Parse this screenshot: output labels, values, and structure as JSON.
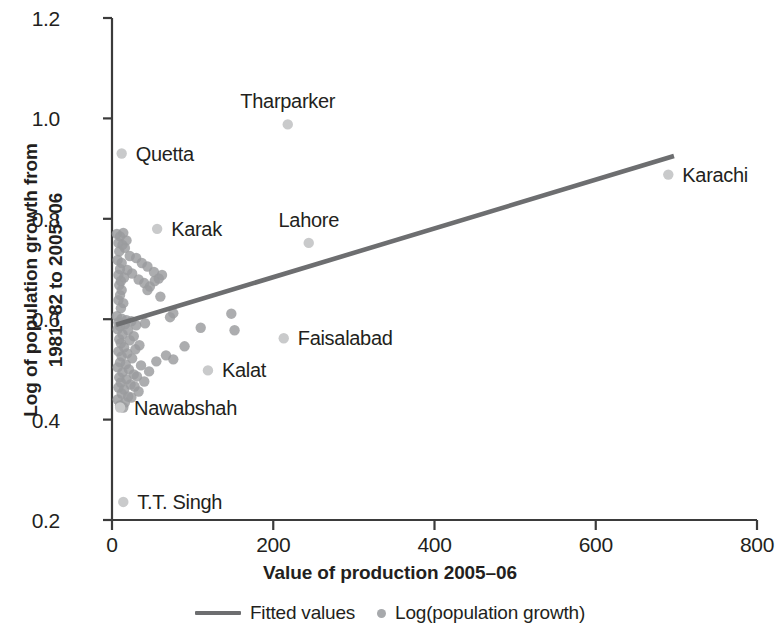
{
  "chart_data": {
    "type": "scatter",
    "title": "",
    "xlabel": "Value of production 2005–06",
    "ylabel_line1": "Log of population growth from",
    "ylabel_line2": "1981–82 to 2005–06",
    "xlim": [
      0,
      800
    ],
    "ylim": [
      0.2,
      1.2
    ],
    "xticks": [
      0,
      200,
      400,
      600,
      800
    ],
    "xtick_labels": [
      "0",
      "200",
      "400",
      "600",
      "800"
    ],
    "yticks": [
      0.2,
      0.4,
      0.6,
      0.8,
      1.0,
      1.2
    ],
    "ytick_labels": [
      "0.2",
      "0.4",
      "0.6",
      "0.8",
      "1.0",
      "1.2"
    ],
    "grid": false,
    "legend_position": "bottom-center",
    "legend": [
      {
        "key": "fitted-values",
        "label": "Fitted values",
        "marker": "line",
        "color": "#6d6e70"
      },
      {
        "key": "log-population-growth",
        "label": "Log(population growth)",
        "marker": "dot",
        "color": "#a7a9ac"
      }
    ],
    "series": [
      {
        "name": "Log(population growth)",
        "marker": "circle",
        "color": "#9a9b9e",
        "points": [
          {
            "x": 6,
            "y": 0.77
          },
          {
            "x": 10,
            "y": 0.765
          },
          {
            "x": 14,
            "y": 0.772
          },
          {
            "x": 8,
            "y": 0.752
          },
          {
            "x": 13,
            "y": 0.748
          },
          {
            "x": 18,
            "y": 0.757
          },
          {
            "x": 9,
            "y": 0.735
          },
          {
            "x": 16,
            "y": 0.742
          },
          {
            "x": 22,
            "y": 0.726
          },
          {
            "x": 7,
            "y": 0.718
          },
          {
            "x": 12,
            "y": 0.712
          },
          {
            "x": 30,
            "y": 0.722
          },
          {
            "x": 10,
            "y": 0.7
          },
          {
            "x": 19,
            "y": 0.698
          },
          {
            "x": 37,
            "y": 0.712
          },
          {
            "x": 8,
            "y": 0.688
          },
          {
            "x": 15,
            "y": 0.683
          },
          {
            "x": 44,
            "y": 0.705
          },
          {
            "x": 11,
            "y": 0.676
          },
          {
            "x": 25,
            "y": 0.691
          },
          {
            "x": 52,
            "y": 0.694
          },
          {
            "x": 9,
            "y": 0.668
          },
          {
            "x": 33,
            "y": 0.679
          },
          {
            "x": 58,
            "y": 0.681
          },
          {
            "x": 12,
            "y": 0.658
          },
          {
            "x": 40,
            "y": 0.672
          },
          {
            "x": 47,
            "y": 0.665
          },
          {
            "x": 10,
            "y": 0.648
          },
          {
            "x": 53,
            "y": 0.676
          },
          {
            "x": 62,
            "y": 0.688
          },
          {
            "x": 8,
            "y": 0.638
          },
          {
            "x": 14,
            "y": 0.632
          },
          {
            "x": 44,
            "y": 0.658
          },
          {
            "x": 11,
            "y": 0.622
          },
          {
            "x": 60,
            "y": 0.645
          },
          {
            "x": 72,
            "y": 0.604
          },
          {
            "x": 6,
            "y": 0.606
          },
          {
            "x": 12,
            "y": 0.601
          },
          {
            "x": 18,
            "y": 0.598
          },
          {
            "x": 8,
            "y": 0.594
          },
          {
            "x": 16,
            "y": 0.59
          },
          {
            "x": 24,
            "y": 0.596
          },
          {
            "x": 10,
            "y": 0.586
          },
          {
            "x": 30,
            "y": 0.588
          },
          {
            "x": 76,
            "y": 0.612
          },
          {
            "x": 7,
            "y": 0.58
          },
          {
            "x": 20,
            "y": 0.578
          },
          {
            "x": 41,
            "y": 0.592
          },
          {
            "x": 13,
            "y": 0.57
          },
          {
            "x": 27,
            "y": 0.566
          },
          {
            "x": 110,
            "y": 0.583
          },
          {
            "x": 9,
            "y": 0.56
          },
          {
            "x": 22,
            "y": 0.558
          },
          {
            "x": 148,
            "y": 0.611
          },
          {
            "x": 11,
            "y": 0.552
          },
          {
            "x": 34,
            "y": 0.548
          },
          {
            "x": 152,
            "y": 0.578
          },
          {
            "x": 15,
            "y": 0.544
          },
          {
            "x": 29,
            "y": 0.54
          },
          {
            "x": 90,
            "y": 0.546
          },
          {
            "x": 8,
            "y": 0.536
          },
          {
            "x": 19,
            "y": 0.532
          },
          {
            "x": 67,
            "y": 0.528
          },
          {
            "x": 12,
            "y": 0.526
          },
          {
            "x": 25,
            "y": 0.522
          },
          {
            "x": 76,
            "y": 0.52
          },
          {
            "x": 10,
            "y": 0.514
          },
          {
            "x": 17,
            "y": 0.51
          },
          {
            "x": 55,
            "y": 0.516
          },
          {
            "x": 7,
            "y": 0.504
          },
          {
            "x": 21,
            "y": 0.5
          },
          {
            "x": 36,
            "y": 0.508
          },
          {
            "x": 13,
            "y": 0.494
          },
          {
            "x": 27,
            "y": 0.49
          },
          {
            "x": 46,
            "y": 0.496
          },
          {
            "x": 9,
            "y": 0.484
          },
          {
            "x": 18,
            "y": 0.48
          },
          {
            "x": 31,
            "y": 0.486
          },
          {
            "x": 11,
            "y": 0.474
          },
          {
            "x": 23,
            "y": 0.47
          },
          {
            "x": 40,
            "y": 0.476
          },
          {
            "x": 8,
            "y": 0.464
          },
          {
            "x": 15,
            "y": 0.46
          },
          {
            "x": 28,
            "y": 0.466
          },
          {
            "x": 12,
            "y": 0.452
          },
          {
            "x": 20,
            "y": 0.446
          },
          {
            "x": 33,
            "y": 0.456
          },
          {
            "x": 7,
            "y": 0.44
          },
          {
            "x": 16,
            "y": 0.434
          },
          {
            "x": 24,
            "y": 0.444
          },
          {
            "x": 10,
            "y": 0.428
          },
          {
            "x": 14,
            "y": 0.424
          }
        ]
      }
    ],
    "annotated_points": [
      {
        "label": "Quetta",
        "x": 12,
        "y": 0.93,
        "label_anchor": "right"
      },
      {
        "label": "Tharparker",
        "x": 218,
        "y": 0.988,
        "label_anchor": "above"
      },
      {
        "label": "Karachi",
        "x": 690,
        "y": 0.888,
        "label_anchor": "right"
      },
      {
        "label": "Karak",
        "x": 56,
        "y": 0.78,
        "label_anchor": "right"
      },
      {
        "label": "Lahore",
        "x": 244,
        "y": 0.752,
        "label_anchor": "above"
      },
      {
        "label": "Faisalabad",
        "x": 213,
        "y": 0.562,
        "label_anchor": "right"
      },
      {
        "label": "Kalat",
        "x": 119,
        "y": 0.498,
        "label_anchor": "right"
      },
      {
        "label": "Nawabshah",
        "x": 10,
        "y": 0.424,
        "label_anchor": "right"
      },
      {
        "label": "T.T. Singh",
        "x": 14,
        "y": 0.236,
        "label_anchor": "right"
      }
    ],
    "fitted_line": {
      "name": "Fitted values",
      "color": "#6d6e70",
      "x0": 5,
      "y0": 0.589,
      "x1": 697,
      "y1": 0.925
    }
  }
}
